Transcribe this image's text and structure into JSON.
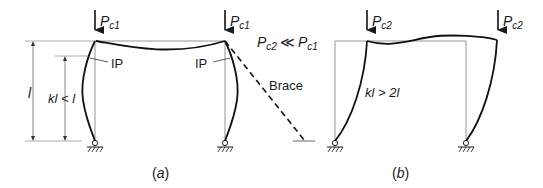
{
  "figure": {
    "panel_a": {
      "caption": "(a)",
      "load_left": {
        "P": "P",
        "sub": "c1"
      },
      "load_right": {
        "P": "P",
        "sub": "c1"
      },
      "ip_left": "IP",
      "ip_right": "IP",
      "dim_outer": "l",
      "dim_inner": "kl < l",
      "relation": {
        "P1": "P",
        "sub1": "c2",
        "op": "≪",
        "P2": "P",
        "sub2": "c1"
      },
      "brace_label": "Brace"
    },
    "panel_b": {
      "caption": "(b)",
      "load_left": {
        "P": "P",
        "sub": "c2"
      },
      "load_right": {
        "P": "P",
        "sub": "c2"
      },
      "length_label": "kl > 2l"
    }
  }
}
